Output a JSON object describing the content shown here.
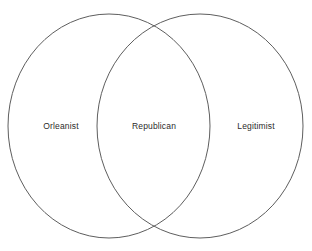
{
  "diagram": {
    "type": "venn-2-set",
    "background_color": "#ffffff",
    "stroke_color": "#5e5e5e",
    "text_color": "#2b2b2b",
    "sets": [
      {
        "id": "left",
        "label": "Orleanist",
        "region": "left-only",
        "cx": 109,
        "cy": 126,
        "rx": 101,
        "ry": 112,
        "label_x": 61,
        "label_y": 126
      },
      {
        "id": "right",
        "label": "Legitimist",
        "region": "right-only",
        "cx": 200,
        "cy": 126,
        "rx": 103,
        "ry": 112,
        "label_x": 256,
        "label_y": 126
      }
    ],
    "intersection": {
      "id": "overlap",
      "label": "Republican",
      "region": "intersection",
      "label_x": 154,
      "label_y": 126
    }
  }
}
